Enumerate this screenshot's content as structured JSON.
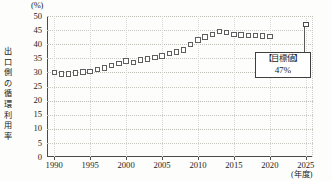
{
  "chart_data": {
    "type": "line",
    "title": "",
    "subtitle": "",
    "ylabel": "出口側の循環利用率",
    "yunit": "(%)",
    "xlabel": "(年度)",
    "ylim": [
      0,
      50
    ],
    "xlim": [
      1989,
      2026
    ],
    "yticks": [
      "0",
      "5",
      "10",
      "15",
      "20",
      "25",
      "30",
      "35",
      "40",
      "45",
      "50"
    ],
    "ytick_values": [
      0,
      5,
      10,
      15,
      20,
      25,
      30,
      35,
      40,
      45,
      50
    ],
    "xticks": [
      "1990",
      "1995",
      "2000",
      "2005",
      "2010",
      "2015",
      "2020",
      "2025"
    ],
    "xtick_values": [
      1990,
      1995,
      2000,
      2005,
      2010,
      2015,
      2020,
      2025
    ],
    "grid": true,
    "legend": "none",
    "marker": "open-square",
    "series": [
      {
        "name": "出口側の循環利用率",
        "x": [
          1990,
          1991,
          1992,
          1993,
          1994,
          1995,
          1996,
          1997,
          1998,
          1999,
          2000,
          2001,
          2002,
          2003,
          2004,
          2005,
          2006,
          2007,
          2008,
          2009,
          2010,
          2011,
          2012,
          2013,
          2014,
          2015,
          2016,
          2017,
          2018,
          2019,
          2020
        ],
        "values": [
          30.0,
          29.4,
          29.4,
          29.8,
          30.1,
          30.3,
          31.0,
          31.5,
          32.5,
          33.2,
          34.0,
          33.6,
          34.4,
          34.8,
          35.2,
          35.8,
          36.6,
          37.3,
          38.0,
          39.9,
          41.5,
          42.6,
          43.4,
          44.5,
          44.2,
          43.5,
          43.2,
          43.0,
          43.0,
          42.9,
          42.8
        ]
      }
    ],
    "target_point": {
      "x": 2025,
      "value": 47,
      "label_line1": "【目標値】",
      "label_line2": "47%"
    }
  },
  "axis": {
    "y_unit_text": "(%)",
    "y_title_text": "出口側の循環利用率",
    "x_unit_text": "(年度)"
  },
  "colors": {
    "axis": "#4a4a4a",
    "grid": "#c7c7c1",
    "marker_stroke": "#5e5e5e",
    "marker_fill": "#ffffff",
    "text": "#1b1b1b",
    "callout_border": "#3f3f3f"
  }
}
